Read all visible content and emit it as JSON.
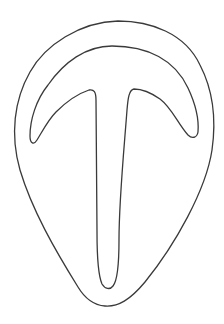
{
  "drawing": {
    "description": "Outline drawing of a rounded, teardrop-shaped outer form containing an anchor/T-shaped inner form with a curved arc top and a long vertical stem",
    "stroke_color": "#3a3a3a",
    "background_color": "#ffffff",
    "shapes": [
      {
        "name": "outer-teardrop-outline"
      },
      {
        "name": "inner-t-arc-outline"
      }
    ]
  }
}
